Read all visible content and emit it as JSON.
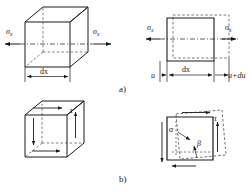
{
  "figure": {
    "panels": [
      {
        "id": "a",
        "caption": "a)",
        "description": "Normal stress sigma-x acting on a cube element and the corresponding elongation of a plane element of width dx",
        "views": [
          "cube-3d-normal-stress",
          "square-2d-elongation"
        ]
      },
      {
        "id": "b",
        "caption": "b)",
        "description": "Shear stress tau acting on a cube element and the corresponding angular distortion of a plane element",
        "views": [
          "cube-3d-shear-stress",
          "square-2d-distortion"
        ]
      }
    ]
  },
  "labels": {
    "sigma_left": "σ",
    "sigma_left_sub": "x",
    "sigma_right": "σ",
    "sigma_right_sub": "x",
    "sigma_2d_left": "σ",
    "sigma_2d_left_sub": "x",
    "sigma_2d_right": "σ",
    "sigma_2d_right_sub": "x",
    "dx_cube": "dx",
    "dx_square": "dx",
    "u": "u",
    "u_plus_du": "u+du",
    "tau_cube": "τ",
    "tau_square": "τ",
    "alpha": "α",
    "beta": "β",
    "caption_a": "a)",
    "caption_b": "b)"
  },
  "colors": {
    "stroke": "#1a1a1a",
    "dashed": "#4d4d4d",
    "background": "#ffffff",
    "text": "#1a1a1a"
  },
  "geometry": {
    "canvas_width": 252,
    "canvas_height": 192,
    "cube_a": {
      "front_x": 25,
      "front_y": 22,
      "size": 45,
      "depth_dx": 18,
      "depth_dy": -15
    },
    "square_a": {
      "x": 167,
      "y": 18,
      "w": 47,
      "h": 43
    },
    "cube_b": {
      "front_x": 25,
      "front_y": 115,
      "size": 42,
      "depth_dx": 17,
      "depth_dy": -14
    },
    "square_b": {
      "x": 167,
      "y": 117,
      "w": 46,
      "h": 43,
      "skew": 9
    }
  }
}
